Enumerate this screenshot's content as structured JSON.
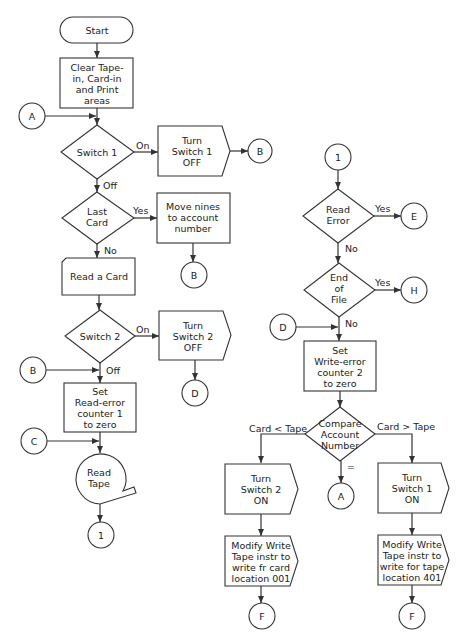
{
  "nodes": {
    "start": {
      "lines": [
        "Start"
      ]
    },
    "clear": {
      "lines": [
        "Clear Tape-",
        "in, Card-in",
        "and Print",
        "areas"
      ]
    },
    "con_a_in": {
      "label": "A"
    },
    "switch1": {
      "lines": [
        "Switch 1"
      ]
    },
    "switch1_on": "On",
    "switch1_off": "Off",
    "turn_sw1_off": {
      "lines": [
        "Turn",
        "Switch 1",
        "OFF"
      ]
    },
    "con_b1": {
      "label": "B"
    },
    "last_card": {
      "lines": [
        "Last",
        "Card"
      ]
    },
    "last_card_yes": "Yes",
    "last_card_no": "No",
    "move_nines": {
      "lines": [
        "Move nines",
        "to account",
        "number"
      ]
    },
    "con_b2": {
      "label": "B"
    },
    "read_card": {
      "lines": [
        "Read a Card"
      ]
    },
    "switch2": {
      "lines": [
        "Switch 2"
      ]
    },
    "switch2_on": "On",
    "switch2_off": "Off",
    "turn_sw2_off": {
      "lines": [
        "Turn",
        "Switch 2",
        "OFF"
      ]
    },
    "con_d1": {
      "label": "D"
    },
    "con_b_in": {
      "label": "B"
    },
    "set_read_err": {
      "lines": [
        "Set",
        "Read-error",
        "counter 1",
        "to zero"
      ]
    },
    "con_c_in": {
      "label": "C"
    },
    "read_tape": {
      "lines": [
        "Read",
        "Tape"
      ]
    },
    "con_1_out": {
      "label": "1"
    },
    "con_1_in": {
      "label": "1"
    },
    "read_error": {
      "lines": [
        "Read",
        "Error"
      ]
    },
    "read_error_yes": "Yes",
    "read_error_no": "No",
    "con_e": {
      "label": "E"
    },
    "eof": {
      "lines": [
        "End",
        "of",
        "File"
      ]
    },
    "eof_yes": "Yes",
    "eof_no": "No",
    "con_h": {
      "label": "H"
    },
    "con_d_in": {
      "label": "D"
    },
    "set_write_err": {
      "lines": [
        "Set",
        "Write-error",
        "counter 2",
        "to zero"
      ]
    },
    "compare": {
      "lines": [
        "Compare",
        "Account",
        "Number"
      ]
    },
    "compare_lt": "Card < Tape",
    "compare_gt": "Card > Tape",
    "compare_eq": "=",
    "turn_sw2_on": {
      "lines": [
        "Turn",
        "Switch 2",
        "ON"
      ]
    },
    "con_a_out": {
      "label": "A"
    },
    "turn_sw1_on": {
      "lines": [
        "Turn",
        "Switch 1",
        "ON"
      ]
    },
    "modify_card": {
      "lines": [
        "Modify Write",
        "Tape instr to",
        "write fr card",
        "location 001"
      ]
    },
    "modify_tape": {
      "lines": [
        "Modify Write",
        "Tape instr to",
        "write for tape",
        "location 401"
      ]
    },
    "con_f1": {
      "label": "F"
    },
    "con_f2": {
      "label": "F"
    }
  }
}
